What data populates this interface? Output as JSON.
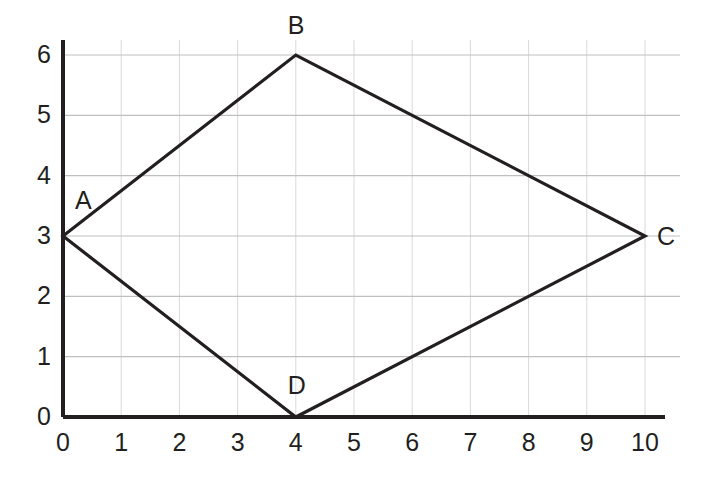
{
  "chart_data": {
    "type": "line",
    "title": "",
    "xlabel": "",
    "ylabel": "",
    "xlim": [
      0,
      10.6
    ],
    "ylim": [
      0,
      6.4
    ],
    "grid": true,
    "legend_position": "none",
    "x_tick_labels": [
      "0",
      "1",
      "2",
      "3",
      "4",
      "5",
      "6",
      "7",
      "8",
      "9",
      "10"
    ],
    "x_tick_values": [
      0,
      1,
      2,
      3,
      4,
      5,
      6,
      7,
      8,
      9,
      10
    ],
    "y_tick_labels": [
      "0",
      "1",
      "2",
      "3",
      "4",
      "5",
      "6"
    ],
    "y_tick_values": [
      0,
      1,
      2,
      3,
      4,
      5,
      6
    ],
    "series": [
      {
        "name": "quadrilateral ABCD",
        "closed": true,
        "points": [
          {
            "label": "A",
            "x": 0,
            "y": 3
          },
          {
            "label": "B",
            "x": 4,
            "y": 6
          },
          {
            "label": "C",
            "x": 10,
            "y": 3
          },
          {
            "label": "D",
            "x": 4,
            "y": 0
          }
        ]
      }
    ],
    "annotations": [
      {
        "text": "A",
        "x": 0,
        "y": 3,
        "dx": 12,
        "dy": -48
      },
      {
        "text": "B",
        "x": 4,
        "y": 6,
        "dx": -8,
        "dy": -42
      },
      {
        "text": "C",
        "x": 10,
        "y": 3,
        "dx": 12,
        "dy": -12
      },
      {
        "text": "D",
        "x": 4,
        "y": 0,
        "dx": -8,
        "dy": -44
      }
    ],
    "colors": {
      "line": "#231f20",
      "axis": "#231f20",
      "grid_horizontal": "#bfbfbf",
      "grid_vertical": "#d9d9d9",
      "text": "#231f20",
      "background": "#ffffff"
    }
  }
}
